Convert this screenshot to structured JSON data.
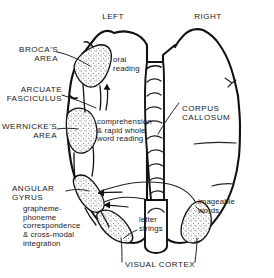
{
  "figure": {
    "hemisphere_labels": {
      "left": "LEFT",
      "right": "RIGHT"
    },
    "colors": {
      "ink": "#1a1a1a",
      "outline": "#111111",
      "stipple": "#5a5a5a",
      "background": "#ffffff"
    }
  },
  "labels": {
    "brocas_area": "BROCA'S\nAREA",
    "arcuate_fasciculus": "ARCUATE\nFASCICULUS",
    "wernickes_area": "WERNICKE'S\nAREA",
    "angular_gyrus": "ANGULAR\nGYRUS",
    "angular_gyrus_detail": "grapheme-\nphoneme\ncorrespondence\n& cross-modal\nintegration",
    "oral_reading": "oral\nreading",
    "comprehension": "comprehension\n& rapid whole\nword reading",
    "corpus_callosum": "CORPUS\nCALLOSUM",
    "imageable_words": "imageable\nwords",
    "letter_strings": "letter\nstrings",
    "visual_cortex": "VISUAL CORTEX"
  },
  "regions": [
    {
      "name": "brocas-area",
      "shaded": true,
      "hemisphere": "left"
    },
    {
      "name": "wernickes-area",
      "shaded": true,
      "hemisphere": "left"
    },
    {
      "name": "angular-gyrus",
      "shaded": true,
      "hemisphere": "left"
    },
    {
      "name": "visual-cortex-left",
      "shaded": true,
      "hemisphere": "left"
    },
    {
      "name": "visual-cortex-right",
      "shaded": true,
      "hemisphere": "right"
    },
    {
      "name": "corpus-callosum",
      "shaded": false,
      "hemisphere": "midline"
    }
  ]
}
